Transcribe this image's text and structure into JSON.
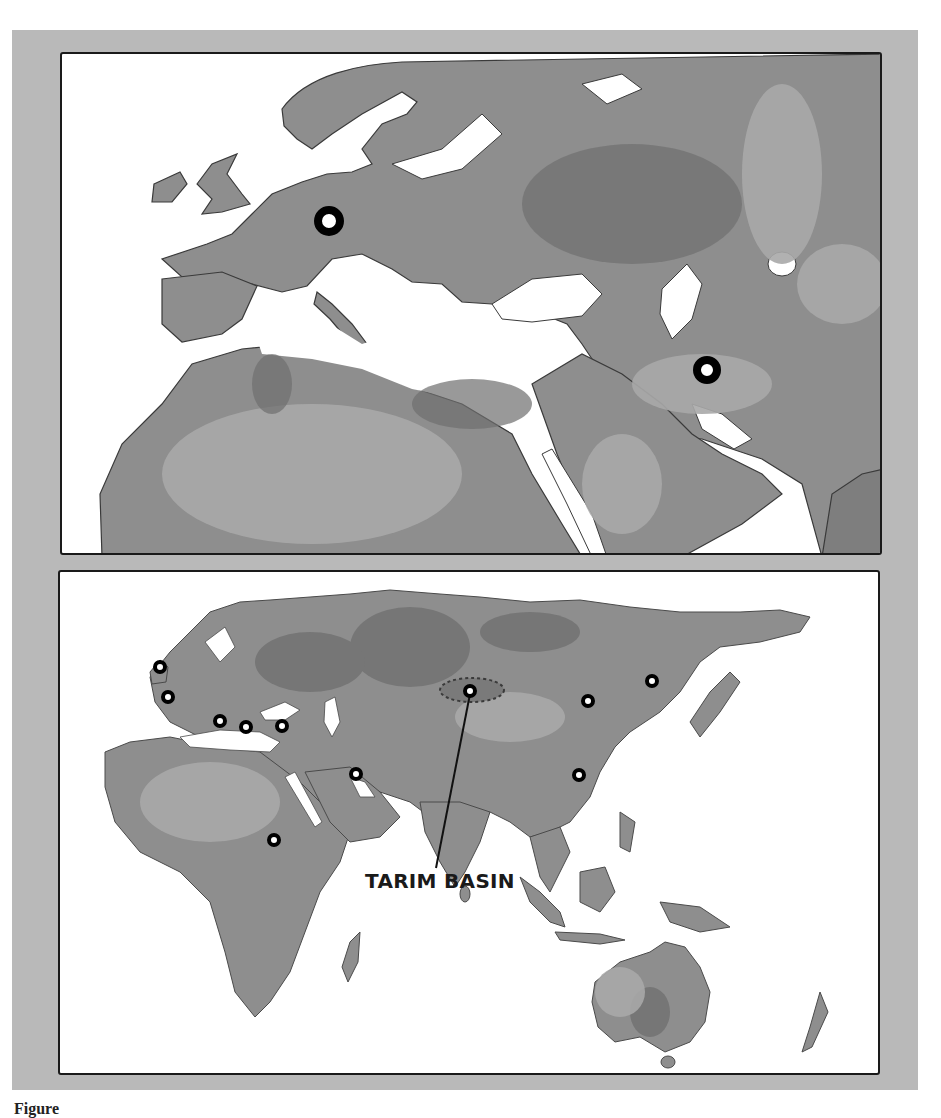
{
  "figure": {
    "caption_visible": "Figure",
    "frame_color": "#b9b9b9",
    "land_color": "#8c8c8c",
    "land_dark_color": "#757575",
    "land_light_color": "#a8a8a8",
    "water_color": "#ffffff",
    "marker_color": "#000000"
  },
  "top_map": {
    "region": "Europe, North Africa and Middle East",
    "markers": [
      {
        "name": "central-europe-site",
        "x": 267,
        "y": 167,
        "size": "large"
      },
      {
        "name": "iran-site",
        "x": 645,
        "y": 316,
        "size": "large"
      }
    ]
  },
  "bottom_map": {
    "region": "Afro-Eurasia and Australia",
    "label": "TARIM BASIN",
    "tarim_basin": {
      "cx": 412,
      "cy": 118,
      "rx": 32,
      "ry": 12
    },
    "markers": [
      {
        "name": "britain-site",
        "x": 100,
        "y": 95
      },
      {
        "name": "france-site",
        "x": 108,
        "y": 125
      },
      {
        "name": "italy-site",
        "x": 160,
        "y": 149
      },
      {
        "name": "greece-site",
        "x": 186,
        "y": 155
      },
      {
        "name": "anatolia-site",
        "x": 222,
        "y": 154
      },
      {
        "name": "mesopotamia-site",
        "x": 296,
        "y": 202
      },
      {
        "name": "egypt-site",
        "x": 214,
        "y": 268
      },
      {
        "name": "tarim-site",
        "x": 410,
        "y": 119
      },
      {
        "name": "north-china-site",
        "x": 528,
        "y": 129
      },
      {
        "name": "manchuria-site",
        "x": 592,
        "y": 109
      },
      {
        "name": "central-china-site",
        "x": 519,
        "y": 203
      }
    ]
  }
}
